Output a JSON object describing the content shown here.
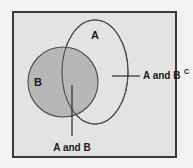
{
  "figure": {
    "type": "venn-diagram",
    "background_color": "#f2f2f2",
    "frame": {
      "fill_color": "#e3e3e3",
      "border_color": "#3a3a3a"
    }
  },
  "sets": {
    "a": {
      "label": "A",
      "shape": "ellipse",
      "fill_color": "#e3e3e3",
      "stroke_color": "#4a4a4a",
      "filled": false
    },
    "b": {
      "label": "B",
      "shape": "circle",
      "fill_color": "#b6b6b6",
      "stroke_color": "#4a4a4a",
      "filled": true
    }
  },
  "callouts": {
    "intersection": {
      "label": "A and B",
      "superscript": ""
    },
    "a_not_b": {
      "label": "A and B",
      "superscript": "C"
    }
  }
}
